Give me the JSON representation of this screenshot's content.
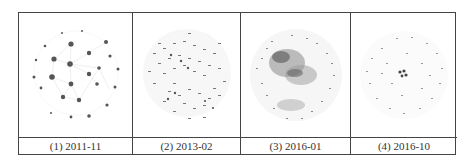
{
  "figure": {
    "panels": [
      {
        "label": "(1) 2011-11",
        "style": "few-large-hubs"
      },
      {
        "label": "(2) 2013-02",
        "style": "two-clusters"
      },
      {
        "label": "(3) 2016-01",
        "style": "dense-core"
      },
      {
        "label": "(4) 2016-10",
        "style": "single-tiny-core"
      }
    ]
  },
  "colors": {
    "border": "#444444",
    "node": "#555555",
    "edge": "#cfcfcf",
    "text": "#333333"
  }
}
